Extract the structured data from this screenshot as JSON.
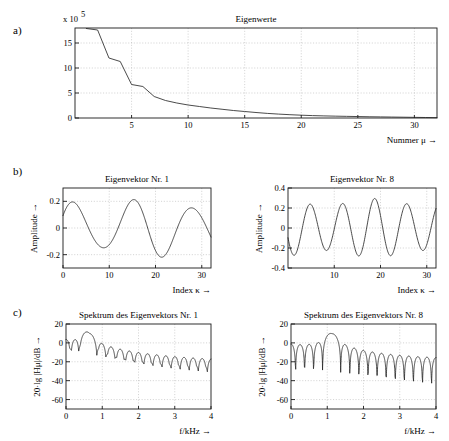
{
  "figure": {
    "panel_labels": {
      "a": "a)",
      "b": "b)",
      "c": "c)"
    }
  },
  "chart_data": [
    {
      "id": "eigenvalues",
      "type": "line",
      "title": "Eigenwerte",
      "xlabel": "Nummer μ →",
      "ylabel": "",
      "y_multiplier_label": "x 10",
      "y_multiplier_exponent": "5",
      "xlim": [
        0,
        32
      ],
      "ylim": [
        0,
        18
      ],
      "xticks": [
        5,
        10,
        15,
        20,
        25,
        30
      ],
      "xticklabels": [
        "5",
        "10",
        "15",
        "20",
        "25",
        "30"
      ],
      "yticks": [
        0,
        5,
        10,
        15
      ],
      "yticklabels": [
        "0",
        "5",
        "10",
        "15"
      ],
      "grid": true,
      "x": [
        1,
        2,
        3,
        4,
        5,
        6,
        7,
        8,
        9,
        10,
        11,
        12,
        13,
        14,
        15,
        16,
        17,
        18,
        19,
        20,
        21,
        22,
        23,
        24,
        25,
        26,
        27,
        28,
        29,
        30,
        31,
        32
      ],
      "values": [
        17.9,
        17.6,
        12.0,
        11.3,
        6.7,
        6.3,
        4.3,
        3.5,
        3.0,
        2.6,
        2.3,
        2.0,
        1.75,
        1.5,
        1.3,
        1.1,
        0.92,
        0.78,
        0.66,
        0.56,
        0.48,
        0.42,
        0.37,
        0.33,
        0.29,
        0.25,
        0.22,
        0.19,
        0.16,
        0.13,
        0.1,
        0.07
      ]
    },
    {
      "id": "eigenvector-1",
      "type": "line",
      "title": "Eigenvektor Nr. 1",
      "xlabel": "Index κ →",
      "ylabel": "Amplitude →",
      "xlim": [
        0,
        32
      ],
      "ylim": [
        -0.3,
        0.3
      ],
      "xticks": [
        0,
        10,
        20,
        30
      ],
      "xticklabels": [
        "0",
        "10",
        "20",
        "30"
      ],
      "yticks": [
        -0.2,
        0,
        0.2
      ],
      "yticklabels": [
        "-0.2",
        "0",
        "0.2"
      ],
      "grid": true,
      "cycles": 2.5,
      "phase_deg": 25,
      "amplitude": 0.19,
      "amplitude_mod": 0.5
    },
    {
      "id": "eigenvector-8",
      "type": "line",
      "title": "Eigenvektor Nr. 8",
      "xlabel": "Index κ →",
      "ylabel": "Amplitude →",
      "xlim": [
        0,
        32
      ],
      "ylim": [
        -0.4,
        0.4
      ],
      "xticks": [
        10,
        20,
        30
      ],
      "xticklabels": [
        "10",
        "20",
        "30"
      ],
      "yticks": [
        -0.4,
        -0.2,
        0,
        0.2,
        0.4
      ],
      "yticklabels": [
        "-0.4",
        "-0.2",
        "0",
        "0.2",
        "0.4"
      ],
      "grid": true,
      "cycles": 4.6,
      "phase_deg": 200,
      "amplitude": 0.26,
      "amplitude_mod": 0.3
    },
    {
      "id": "spectrum-1",
      "type": "line",
      "title": "Spektrum des Eigenvektors Nr. 1",
      "xlabel": "f/kHz →",
      "ylabel": "20·lg |Hμ|/dB →",
      "xlim": [
        0,
        4
      ],
      "ylim": [
        -70,
        20
      ],
      "xticks": [
        0,
        1,
        2,
        3,
        4
      ],
      "xticklabels": [
        "0",
        "1",
        "2",
        "3",
        "4"
      ],
      "yticks": [
        -60,
        -40,
        -20,
        0,
        20
      ],
      "yticklabels": [
        "-60",
        "-40",
        "-20",
        "0",
        "20"
      ],
      "grid": true,
      "center_khz": 0.6,
      "peak_db": 12,
      "lobe_count": 16,
      "taper_db": 30
    },
    {
      "id": "spectrum-8",
      "type": "line",
      "title": "Spektrum des Eigenvektors Nr. 8",
      "xlabel": "f/kHz →",
      "ylabel": "20·lg |Hμ|/dB →",
      "xlim": [
        0,
        4
      ],
      "ylim": [
        -70,
        20
      ],
      "xticks": [
        0,
        1,
        2,
        3,
        4
      ],
      "xticklabels": [
        "0",
        "1",
        "2",
        "3",
        "4"
      ],
      "yticks": [
        -60,
        -40,
        -20,
        0,
        20
      ],
      "yticklabels": [
        "-60",
        "-40",
        "-20",
        "0",
        "20"
      ],
      "grid": true,
      "center_khz": 1.12,
      "peak_db": 12,
      "lobe_count": 16,
      "taper_db": 28
    }
  ]
}
